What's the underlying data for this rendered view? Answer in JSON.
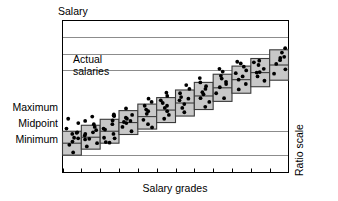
{
  "chart_data": {
    "type": "box",
    "title": "",
    "ylabel": "Salary",
    "xlabel": "Salary grades",
    "right_axis_label": "Ratio scale",
    "annotation": "Actual salaries",
    "annotation_line1": "Actual",
    "annotation_line2": "salaries",
    "y_tick_labels": [
      "Maximum",
      "Midpoint",
      "Minimum"
    ],
    "grid": true,
    "grid_note": "horizontal ratio-scale gridlines, unlabeled except the three range markers",
    "legend": "none",
    "x_tick_count": 12,
    "categories": [
      "1",
      "2",
      "3",
      "4",
      "5",
      "6",
      "7",
      "8",
      "9",
      "10",
      "11",
      "12"
    ],
    "series": [
      {
        "name": "Salary range (minimum / midpoint / maximum)",
        "box_fill": "#c8c8c8",
        "box_stroke": "#333333",
        "boxes": [
          {
            "grade": "1",
            "minimum": 0.0,
            "midpoint": 1.1,
            "maximum": 2.2
          },
          {
            "grade": "2",
            "minimum": 0.55,
            "midpoint": 1.65,
            "maximum": 2.75
          },
          {
            "grade": "3",
            "minimum": 1.1,
            "midpoint": 2.2,
            "maximum": 3.3
          },
          {
            "grade": "4",
            "minimum": 1.9,
            "midpoint": 3.0,
            "maximum": 4.1
          },
          {
            "grade": "5",
            "minimum": 2.4,
            "midpoint": 3.55,
            "maximum": 4.7
          },
          {
            "grade": "6",
            "minimum": 3.0,
            "midpoint": 4.15,
            "maximum": 5.3
          },
          {
            "grade": "7",
            "minimum": 3.6,
            "midpoint": 4.8,
            "maximum": 6.0
          },
          {
            "grade": "8",
            "minimum": 4.2,
            "midpoint": 5.45,
            "maximum": 6.7
          },
          {
            "grade": "9",
            "minimum": 4.95,
            "midpoint": 6.2,
            "maximum": 7.45
          },
          {
            "grade": "10",
            "minimum": 5.7,
            "midpoint": 6.95,
            "maximum": 8.2
          },
          {
            "grade": "11",
            "minimum": 6.3,
            "midpoint": 7.6,
            "maximum": 8.9
          },
          {
            "grade": "12",
            "minimum": 6.9,
            "midpoint": 8.3,
            "maximum": 9.7
          }
        ]
      },
      {
        "name": "Actual salaries (individual employees)",
        "marker": "filled-circle",
        "marker_color": "#000000",
        "points": [
          {
            "grade": 1,
            "values": [
              0.25,
              0.95,
              1.25,
              1.55,
              1.6,
              1.95,
              2.05,
              2.1,
              2.45,
              2.95,
              3.35
            ]
          },
          {
            "grade": 2,
            "values": [
              0.8,
              1.1,
              1.45,
              1.5,
              1.8,
              1.95,
              2.1,
              2.3,
              2.6,
              2.85,
              3.15,
              3.55
            ]
          },
          {
            "grade": 3,
            "values": [
              1.15,
              1.2,
              1.55,
              1.6,
              1.95,
              2.35,
              2.45,
              2.85,
              3.2,
              3.6,
              3.65,
              3.75
            ]
          },
          {
            "grade": 4,
            "values": [
              2.2,
              2.6,
              2.95,
              3.05,
              3.15,
              3.35,
              3.45,
              3.7,
              4.3
            ]
          },
          {
            "grade": 5,
            "values": [
              2.55,
              2.85,
              3.25,
              3.8,
              4.05,
              4.2,
              4.55,
              4.9,
              5.2
            ]
          },
          {
            "grade": 6,
            "values": [
              3.35,
              3.7,
              4.05,
              4.35,
              4.55,
              4.8,
              5.05,
              5.45,
              5.75
            ]
          },
          {
            "grade": 7,
            "values": [
              3.95,
              4.35,
              4.7,
              5.05,
              5.2,
              5.35,
              5.7,
              6.1,
              6.45
            ]
          },
          {
            "grade": 8,
            "values": [
              4.45,
              4.9,
              5.25,
              5.6,
              5.8,
              6.1,
              6.35,
              6.7,
              7.1
            ]
          },
          {
            "grade": 9,
            "values": [
              5.25,
              5.7,
              6.25,
              6.55,
              6.75,
              7.05,
              7.3,
              7.7,
              7.95
            ]
          },
          {
            "grade": 10,
            "values": [
              6.05,
              6.55,
              6.95,
              7.25,
              7.55,
              7.8,
              8.15,
              8.45,
              8.6
            ]
          },
          {
            "grade": 11,
            "values": [
              6.85,
              7.25,
              7.6,
              7.65,
              7.95,
              8.3,
              8.55,
              8.7
            ]
          },
          {
            "grade": 12,
            "values": [
              7.5,
              7.9,
              8.4,
              8.75,
              8.95,
              9.05,
              9.45,
              9.85
            ]
          }
        ]
      }
    ],
    "ylim": [
      -1.6,
      12.4
    ],
    "xlim": [
      0,
      12
    ]
  },
  "colors": {
    "box_fill": "#c8c8c8",
    "box_stroke": "#3a3a3a",
    "frame": "#000000",
    "gridline": "#8c8c8c",
    "dot": "#000000",
    "background": "#ffffff"
  }
}
